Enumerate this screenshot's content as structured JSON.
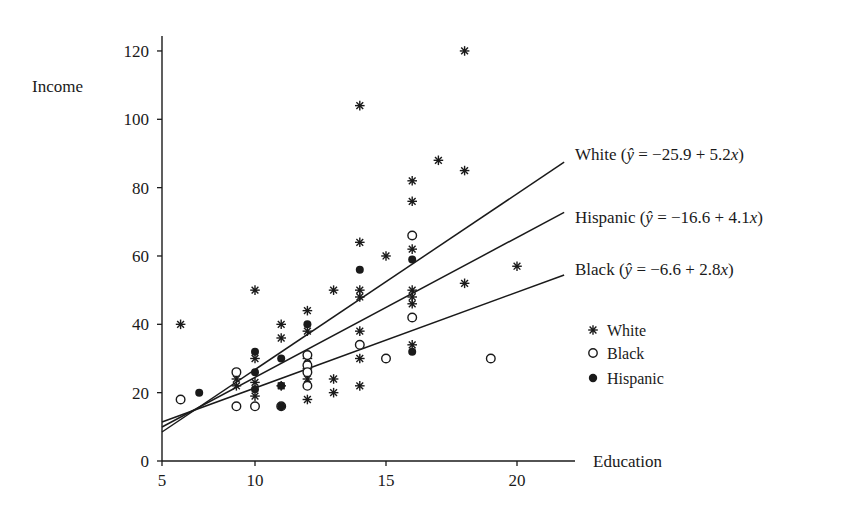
{
  "chart_data": {
    "type": "scatter",
    "title": "",
    "xlabel": "Education",
    "ylabel": "Income",
    "xlim": [
      5,
      22
    ],
    "ylim": [
      0,
      125
    ],
    "x_ticks": [
      5,
      10,
      15,
      20
    ],
    "y_ticks": [
      0,
      20,
      40,
      60,
      80,
      100,
      120
    ],
    "grid": false,
    "legend": {
      "position": "right",
      "entries": [
        {
          "label": "White",
          "marker": "asterisk"
        },
        {
          "label": "Black",
          "marker": "open-circle"
        },
        {
          "label": "Hispanic",
          "marker": "filled-circle"
        }
      ]
    },
    "series": [
      {
        "name": "White",
        "marker": "asterisk",
        "points": [
          [
            6,
            40
          ],
          [
            9,
            24
          ],
          [
            9,
            22
          ],
          [
            10,
            50
          ],
          [
            10,
            30
          ],
          [
            10,
            23
          ],
          [
            10,
            19
          ],
          [
            11,
            40
          ],
          [
            11,
            36
          ],
          [
            11,
            22
          ],
          [
            12,
            44
          ],
          [
            12,
            38
          ],
          [
            12,
            30
          ],
          [
            12,
            27
          ],
          [
            12,
            24
          ],
          [
            12,
            18
          ],
          [
            13,
            50
          ],
          [
            13,
            24
          ],
          [
            13,
            20
          ],
          [
            14,
            104
          ],
          [
            14,
            64
          ],
          [
            14,
            50
          ],
          [
            14,
            48
          ],
          [
            14,
            38
          ],
          [
            14,
            30
          ],
          [
            14,
            22
          ],
          [
            15,
            60
          ],
          [
            16,
            82
          ],
          [
            16,
            76
          ],
          [
            16,
            62
          ],
          [
            16,
            50
          ],
          [
            16,
            48
          ],
          [
            16,
            46
          ],
          [
            16,
            34
          ],
          [
            17,
            88
          ],
          [
            18,
            120
          ],
          [
            18,
            85
          ],
          [
            18,
            52
          ],
          [
            20,
            57
          ]
        ]
      },
      {
        "name": "Black",
        "marker": "open-circle",
        "points": [
          [
            6,
            18
          ],
          [
            9,
            26
          ],
          [
            9,
            16
          ],
          [
            10,
            16
          ],
          [
            11,
            16
          ],
          [
            12,
            31
          ],
          [
            12,
            28
          ],
          [
            12,
            26
          ],
          [
            12,
            22
          ],
          [
            14,
            34
          ],
          [
            15,
            30
          ],
          [
            16,
            66
          ],
          [
            16,
            42
          ],
          [
            19,
            30
          ]
        ]
      },
      {
        "name": "Hispanic",
        "marker": "filled-circle",
        "points": [
          [
            7,
            20
          ],
          [
            10,
            32
          ],
          [
            10,
            26
          ],
          [
            10,
            21
          ],
          [
            11,
            30
          ],
          [
            11,
            22
          ],
          [
            11,
            16
          ],
          [
            12,
            40
          ],
          [
            14,
            56
          ],
          [
            16,
            59
          ],
          [
            16,
            32
          ]
        ]
      }
    ],
    "regression_lines": [
      {
        "group": "White",
        "label": "White (ŷ = −25.9 + 5.2x)",
        "intercept": -25.9,
        "slope": 5.2
      },
      {
        "group": "Hispanic",
        "label": "Hispanic (ŷ = −16.6 + 4.1x)",
        "intercept": -16.6,
        "slope": 4.1
      },
      {
        "group": "Black",
        "label": "Black (ŷ = −6.6 + 2.8x)",
        "intercept": -6.6,
        "slope": 2.8
      }
    ]
  },
  "labels": {
    "ylabel": "Income",
    "xlabel": "Education",
    "line_white": "White (ŷ = −25.9 + 5.2x)",
    "line_white_name": "White (",
    "line_white_eq": " = −25.9 + 5.2",
    "line_hispanic_name": "Hispanic (",
    "line_hispanic_eq": " = −16.6 + 4.1",
    "line_black_name": "Black (",
    "line_black_eq": " = −6.6 + 2.8",
    "yhat": "ŷ",
    "x_var": "x",
    "close_paren": ")",
    "legend_white": "White",
    "legend_black": "Black",
    "legend_hispanic": "Hispanic"
  }
}
